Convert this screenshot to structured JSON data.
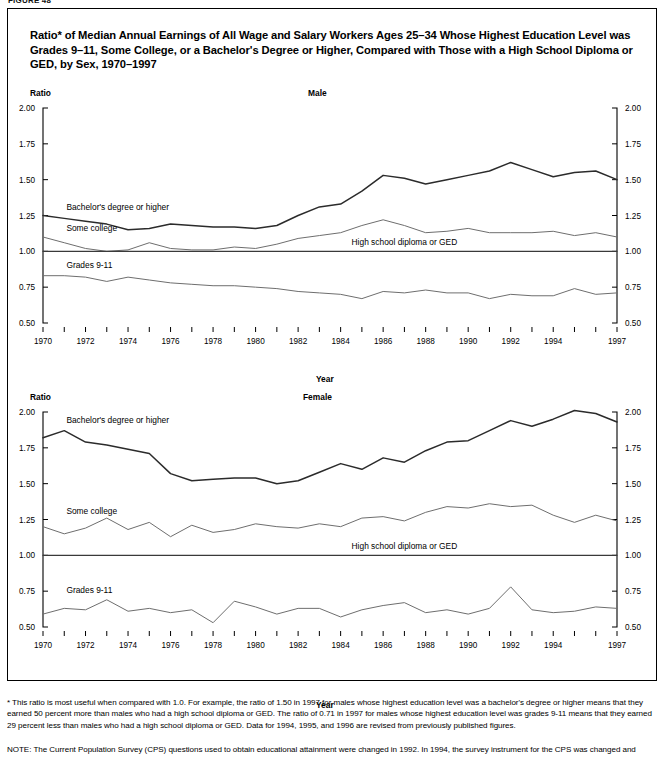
{
  "figure_tag": "FIGURE 48",
  "title": "Ratio* of Median Annual Earnings of All Wage and Salary Workers Ages 25–34 Whose Highest Education Level was Grades 9–11, Some College, or a Bachelor's Degree or Higher, Compared with Those with a High School Diploma or GED, by Sex, 1970–1997",
  "axis": {
    "ratio_label": "Ratio",
    "year_label": "Year",
    "ytick_labels": [
      "2.00",
      "1.75",
      "1.50",
      "1.25",
      "1.00",
      "0.75",
      "0.50"
    ],
    "xtick_labels": [
      "1970",
      "1972",
      "1974",
      "1976",
      "1978",
      "1980",
      "1982",
      "1984",
      "1986",
      "1988",
      "1990",
      "1992",
      "1994",
      "1997"
    ]
  },
  "series_labels": {
    "bachelors": "Bachelor's degree or higher",
    "some_college": "Some college",
    "grades": "Grades 9-11",
    "hs": "High school diploma or GED"
  },
  "panels": [
    {
      "name": "male",
      "label": "Male"
    },
    {
      "name": "female",
      "label": "Female"
    }
  ],
  "footnote": "* This ratio is most useful when compared with 1.0.  For example, the ratio of 1.50 in 1997 for males whose highest education level was a bachelor's degree or higher means that they earned 50 percent more than males who had a high school diploma or GED.  The ratio of 0.71 in 1997 for males whose highest education level was grades 9-11 means that they earned 29 percent less than males who had a high school diploma or GED.  Data for 1994, 1995, and 1996 are revised from previously published figures.",
  "note": "NOTE: The Current Population Survey (CPS) questions used to obtain educational attainment were changed in 1992.  In 1994, the survey instrument for the CPS was changed and",
  "chart_data": [
    {
      "type": "line",
      "title": "Male",
      "xlabel": "Year",
      "ylabel": "Ratio",
      "ylim": [
        0.5,
        2.0
      ],
      "yticks": [
        0.5,
        0.75,
        1.0,
        1.25,
        1.5,
        1.75,
        2.0
      ],
      "grid": false,
      "legend": "inline-labels",
      "x": [
        1970,
        1971,
        1972,
        1973,
        1974,
        1975,
        1976,
        1977,
        1978,
        1979,
        1980,
        1981,
        1982,
        1983,
        1984,
        1985,
        1986,
        1987,
        1988,
        1989,
        1990,
        1991,
        1992,
        1993,
        1994,
        1995,
        1996,
        1997
      ],
      "series": [
        {
          "name": "Bachelor's degree or higher",
          "values": [
            1.25,
            1.23,
            1.21,
            1.19,
            1.15,
            1.16,
            1.19,
            1.18,
            1.17,
            1.17,
            1.16,
            1.18,
            1.25,
            1.31,
            1.33,
            1.42,
            1.53,
            1.51,
            1.47,
            1.5,
            1.53,
            1.56,
            1.62,
            1.57,
            1.52,
            1.55,
            1.56,
            1.5
          ]
        },
        {
          "name": "Some college",
          "values": [
            1.1,
            1.06,
            1.02,
            1.0,
            1.01,
            1.06,
            1.02,
            1.01,
            1.01,
            1.03,
            1.02,
            1.05,
            1.09,
            1.11,
            1.13,
            1.18,
            1.22,
            1.18,
            1.13,
            1.14,
            1.16,
            1.13,
            1.13,
            1.13,
            1.14,
            1.11,
            1.13,
            1.1
          ]
        },
        {
          "name": "Grades 9-11",
          "values": [
            0.83,
            0.83,
            0.82,
            0.79,
            0.82,
            0.8,
            0.78,
            0.77,
            0.76,
            0.76,
            0.75,
            0.74,
            0.72,
            0.71,
            0.7,
            0.67,
            0.72,
            0.71,
            0.73,
            0.71,
            0.71,
            0.67,
            0.7,
            0.69,
            0.69,
            0.74,
            0.7,
            0.71
          ]
        },
        {
          "name": "High school diploma or GED",
          "values": [
            1.0,
            1.0,
            1.0,
            1.0,
            1.0,
            1.0,
            1.0,
            1.0,
            1.0,
            1.0,
            1.0,
            1.0,
            1.0,
            1.0,
            1.0,
            1.0,
            1.0,
            1.0,
            1.0,
            1.0,
            1.0,
            1.0,
            1.0,
            1.0,
            1.0,
            1.0,
            1.0,
            1.0
          ]
        }
      ]
    },
    {
      "type": "line",
      "title": "Female",
      "xlabel": "Year",
      "ylabel": "Ratio",
      "ylim": [
        0.5,
        2.0
      ],
      "yticks": [
        0.5,
        0.75,
        1.0,
        1.25,
        1.5,
        1.75,
        2.0
      ],
      "grid": false,
      "legend": "inline-labels",
      "x": [
        1970,
        1971,
        1972,
        1973,
        1974,
        1975,
        1976,
        1977,
        1978,
        1979,
        1980,
        1981,
        1982,
        1983,
        1984,
        1985,
        1986,
        1987,
        1988,
        1989,
        1990,
        1991,
        1992,
        1993,
        1994,
        1995,
        1996,
        1997
      ],
      "series": [
        {
          "name": "Bachelor's degree or higher",
          "values": [
            1.82,
            1.87,
            1.79,
            1.77,
            1.74,
            1.71,
            1.57,
            1.52,
            1.53,
            1.54,
            1.54,
            1.5,
            1.52,
            1.58,
            1.64,
            1.6,
            1.68,
            1.65,
            1.73,
            1.79,
            1.8,
            1.87,
            1.94,
            1.9,
            1.95,
            2.01,
            1.99,
            1.93
          ]
        },
        {
          "name": "Some college",
          "values": [
            1.2,
            1.15,
            1.19,
            1.26,
            1.18,
            1.23,
            1.13,
            1.21,
            1.16,
            1.18,
            1.22,
            1.2,
            1.19,
            1.22,
            1.2,
            1.26,
            1.27,
            1.24,
            1.3,
            1.34,
            1.33,
            1.36,
            1.34,
            1.35,
            1.28,
            1.23,
            1.28,
            1.24
          ]
        },
        {
          "name": "Grades 9-11",
          "values": [
            0.59,
            0.63,
            0.62,
            0.69,
            0.61,
            0.63,
            0.6,
            0.62,
            0.53,
            0.68,
            0.64,
            0.59,
            0.63,
            0.63,
            0.57,
            0.62,
            0.65,
            0.67,
            0.6,
            0.62,
            0.59,
            0.63,
            0.78,
            0.62,
            0.6,
            0.61,
            0.64,
            0.63
          ]
        },
        {
          "name": "High school diploma or GED",
          "values": [
            1.0,
            1.0,
            1.0,
            1.0,
            1.0,
            1.0,
            1.0,
            1.0,
            1.0,
            1.0,
            1.0,
            1.0,
            1.0,
            1.0,
            1.0,
            1.0,
            1.0,
            1.0,
            1.0,
            1.0,
            1.0,
            1.0,
            1.0,
            1.0,
            1.0,
            1.0,
            1.0,
            1.0
          ]
        }
      ]
    }
  ]
}
